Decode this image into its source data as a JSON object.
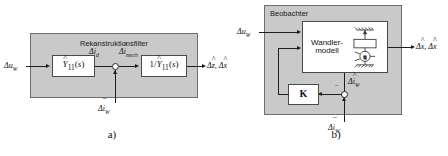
{
  "figure": {
    "panels": [
      {
        "id": "a",
        "caption": "a)",
        "container_title": "Rekonstruktionsfilter",
        "blocks": [
          {
            "name": "admittance-block",
            "label": "Ŷ11(s)"
          },
          {
            "name": "inverse-admittance-block",
            "label": "1/Ŷ11(s)"
          }
        ],
        "signals": {
          "input": "Δu_W",
          "internal_left": "Δî_d",
          "internal_right": "Δî_mech",
          "feedback_bottom": "Δī_W",
          "output": "Δẑ, Δx̂"
        },
        "sum_sign": "−"
      },
      {
        "id": "b",
        "caption": "b)",
        "container_title": "Beobachter",
        "blocks": [
          {
            "name": "transducer-model-block",
            "label": "Wandler-modell"
          },
          {
            "name": "gain-block",
            "label": "K"
          }
        ],
        "signals": {
          "input": "Δu_W",
          "model_current": "Δî_W",
          "measured_current": "Δī_W",
          "output": "Δx̂, Δx̂̇"
        },
        "sum_sign": "−"
      }
    ]
  },
  "colors": {
    "container_fill": "#c9c9c9",
    "container_border": "#6e6e6e",
    "block_fill": "#ffffff",
    "line": "#1d1d1d",
    "background": "#ffffff"
  }
}
